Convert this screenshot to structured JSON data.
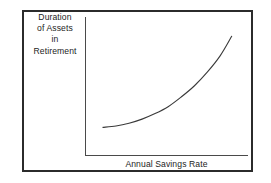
{
  "chart_data": {
    "type": "line",
    "title": "",
    "subtitle": "",
    "xlabel": "Annual Savings Rate",
    "ylabel_lines": [
      "Duration",
      "of Assets",
      "in",
      "Retirement"
    ],
    "ylabel": "Duration of Assets in Retirement",
    "grid": false,
    "legend": null,
    "legend_position": "none",
    "axis_ticks": false,
    "tick_labels": {
      "x": [],
      "y": []
    },
    "xlim": [
      0,
      1
    ],
    "ylim": [
      0,
      1
    ],
    "annotations": [],
    "series": [
      {
        "name": "Duration of Assets in Retirement",
        "color": "#3a3a3a",
        "x": [
          0.11,
          0.19,
          0.27,
          0.35,
          0.43,
          0.51,
          0.59,
          0.67,
          0.75,
          0.83,
          0.9
        ],
        "y": [
          0.2,
          0.21,
          0.23,
          0.26,
          0.3,
          0.35,
          0.42,
          0.5,
          0.6,
          0.72,
          0.86
        ]
      }
    ]
  },
  "figure": {
    "frame_color": "#2b2b2b",
    "axis_color": "#4a4a4a",
    "curve_color": "#3a3a3a",
    "background": "#ffffff"
  }
}
